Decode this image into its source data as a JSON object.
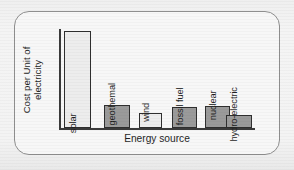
{
  "chart_data": {
    "type": "bar",
    "title": "",
    "xlabel": "Energy source",
    "ylabel": "Cost per Unit of electricity",
    "ylabel_line1": "Cost per Unit of",
    "ylabel_line2": "electricity",
    "categories": [
      "solar",
      "geothemal",
      "wind",
      "fossil fuel",
      "nuclear",
      "hydro-electric"
    ],
    "values": [
      98,
      23,
      15,
      21,
      22,
      13
    ],
    "ylim": [
      0,
      100
    ],
    "grid": false,
    "legend": null,
    "y_tick_labels": [],
    "x_tick_labels": [],
    "bars": [
      {
        "label": "solar",
        "value": 98,
        "fill": "#ededed",
        "stroke": "#2f2f2f",
        "label_position": "inside"
      },
      {
        "label": "geothemal",
        "value": 23,
        "fill": "#9a9a9a",
        "stroke": "#2f2f2f",
        "label_position": "outside"
      },
      {
        "label": "wind",
        "value": 15,
        "fill": "#ededed",
        "stroke": "#2f2f2f",
        "label_position": "outside"
      },
      {
        "label": "fossil fuel",
        "value": 21,
        "fill": "#9a9a9a",
        "stroke": "#2f2f2f",
        "label_position": "outside"
      },
      {
        "label": "nuclear",
        "value": 22,
        "fill": "#9a9a9a",
        "stroke": "#2f2f2f",
        "label_position": "outside"
      },
      {
        "label": "hydro-electric",
        "value": 13,
        "fill": "#9a9a9a",
        "stroke": "#2f2f2f",
        "label_position": "outside"
      }
    ]
  },
  "colors": {
    "page_background": "#f2f2f2",
    "frame_background": "#f7f7f7",
    "frame_border": "#8e8e8e",
    "axis": "#3a3a3a",
    "text": "#1f1f1f",
    "bar_light": "#ededed",
    "bar_dark": "#9a9a9a"
  }
}
